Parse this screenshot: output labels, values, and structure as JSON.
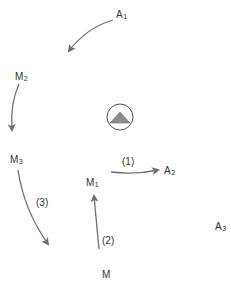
{
  "title_fragment": "",
  "nodes": {
    "A1": {
      "base": "A",
      "sub": "1"
    },
    "A2": {
      "base": "A",
      "sub": "2"
    },
    "A3": {
      "base": "A",
      "sub": "3"
    },
    "M": {
      "base": "M",
      "sub": ""
    },
    "M1": {
      "base": "M",
      "sub": "1"
    },
    "M2": {
      "base": "M",
      "sub": "2"
    },
    "M3": {
      "base": "M",
      "sub": "3"
    }
  },
  "steps": {
    "s1": "(1)",
    "s2": "(2)",
    "s3": "(3)"
  },
  "center_icon": "triangle-in-circle-icon",
  "colors": {
    "arrow": "#6e6e6e",
    "text": "#333333",
    "triangle_fill": "#8c8c8c"
  }
}
